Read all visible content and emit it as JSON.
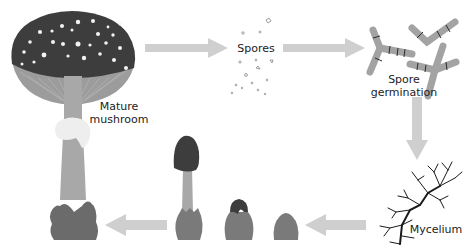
{
  "colors": {
    "arrow": "#cfcfcf",
    "cap_dark": "#3d3d3d",
    "spots": "#f2f2f2",
    "gills": "#9c9c9c",
    "stem": "#a8a8a8",
    "ring": "#eeeeee",
    "volva": "#6b6b6b",
    "hyphae": "#a3a3a3",
    "hyphae_septa": "#2b2b2b",
    "mycelium": "#1a1a1a",
    "bulb": "#7a7a7a",
    "text": "#222222"
  },
  "stages": [
    {
      "id": "mature-mushroom",
      "label_line1": "Mature",
      "label_line2": "mushroom"
    },
    {
      "id": "spores",
      "label": "Spores"
    },
    {
      "id": "spore-germination",
      "label_line1": "Spore",
      "label_line2": "germination"
    },
    {
      "id": "mycelium",
      "label": "Mycelium"
    },
    {
      "id": "primordium",
      "label": ""
    },
    {
      "id": "button",
      "label": ""
    },
    {
      "id": "young-mushroom",
      "label": ""
    }
  ],
  "arrows": [
    {
      "from": "mature-mushroom",
      "to": "spores",
      "direction": "right"
    },
    {
      "from": "spores",
      "to": "spore-germination",
      "direction": "right"
    },
    {
      "from": "spore-germination",
      "to": "mycelium",
      "direction": "down"
    },
    {
      "from": "mycelium",
      "to": "primordium",
      "direction": "left"
    },
    {
      "from": "young-mushroom",
      "to": "mature-mushroom",
      "direction": "left"
    }
  ]
}
